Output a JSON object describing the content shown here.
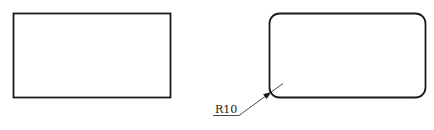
{
  "diagram": {
    "background": "#ffffff",
    "stroke_color": "#1a1a1a",
    "shapes": [
      {
        "name": "sharp-rectangle",
        "x": 13,
        "y": 13,
        "width": 157,
        "height": 84,
        "corner_radius": 0
      },
      {
        "name": "rounded-rectangle",
        "x": 269,
        "y": 13,
        "width": 156,
        "height": 84,
        "corner_radius": 10
      }
    ],
    "annotation": {
      "label": "R10",
      "meaning": "corner radius dimension"
    }
  }
}
